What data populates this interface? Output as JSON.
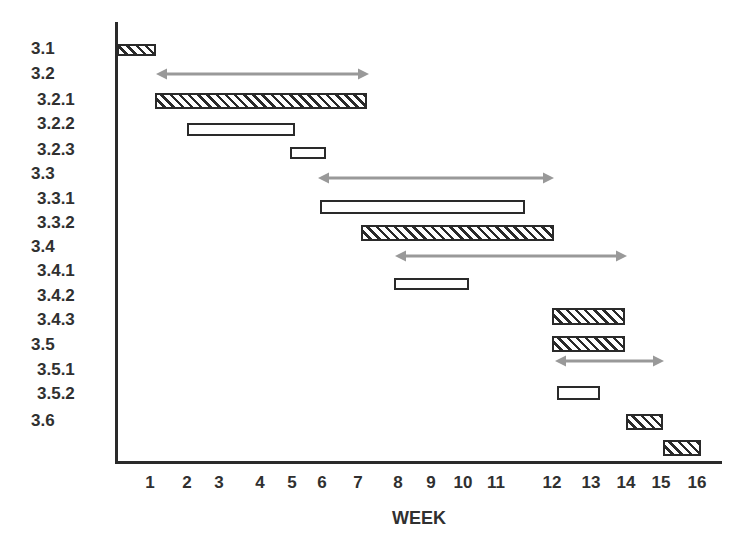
{
  "chart_data": {
    "type": "gantt",
    "title": "",
    "xlabel": "WEEK",
    "ylabel": "",
    "x_ticks": [
      "1",
      "2",
      "3",
      "4",
      "5",
      "6",
      "7",
      "8",
      "9",
      "10",
      "11",
      "12",
      "13",
      "14",
      "15",
      "16"
    ],
    "x_tick_px": [
      150,
      187,
      219,
      260,
      292,
      322,
      358,
      398,
      431,
      463,
      496,
      552,
      591,
      626,
      661,
      697
    ],
    "grid": false,
    "legend": null,
    "style_key": {
      "hatched": "diagonal-hatched bar (task)",
      "open": "outlined white bar (task)",
      "arrow": "grey double-headed arrow (phase span)"
    },
    "colors": {
      "bar_outline": "#2a2a2a",
      "arrow": "#999999",
      "axis": "#2a2a2a",
      "text": "#303030"
    },
    "rows": [
      {
        "label": "3.1",
        "indent": 0,
        "label_y": 49
      },
      {
        "label": "3.2",
        "indent": 0,
        "label_y": 74
      },
      {
        "label": "3.2.1",
        "indent": 1,
        "label_y": 100
      },
      {
        "label": "3.2.2",
        "indent": 1,
        "label_y": 124
      },
      {
        "label": "3.2.3",
        "indent": 1,
        "label_y": 150
      },
      {
        "label": "3.3",
        "indent": 0,
        "label_y": 174
      },
      {
        "label": "3.3.1",
        "indent": 1,
        "label_y": 199
      },
      {
        "label": "3.3.2",
        "indent": 1,
        "label_y": 223
      },
      {
        "label": "3.4",
        "indent": 0,
        "label_y": 247
      },
      {
        "label": "3.4.1",
        "indent": 1,
        "label_y": 271
      },
      {
        "label": "3.4.2",
        "indent": 1,
        "label_y": 296
      },
      {
        "label": "3.4.3",
        "indent": 1,
        "label_y": 320
      },
      {
        "label": "3.5",
        "indent": 0,
        "label_y": 345
      },
      {
        "label": "3.5.1",
        "indent": 1,
        "label_y": 370
      },
      {
        "label": "3.5.2",
        "indent": 1,
        "label_y": 394
      },
      {
        "label": "3.6",
        "indent": 0,
        "label_y": 421
      }
    ],
    "tasks": [
      {
        "row": "3.1",
        "kind": "hatched",
        "start_week": 0,
        "end_week": 1,
        "x0": 117,
        "x1": 156,
        "y0": 44,
        "y1": 56
      },
      {
        "row": "3.2",
        "kind": "arrow",
        "start_week": 1,
        "end_week": 7.3,
        "x0": 156,
        "x1": 369,
        "y": 74
      },
      {
        "row": "3.2.1",
        "kind": "hatched",
        "start_week": 1,
        "end_week": 7.2,
        "x0": 155,
        "x1": 367,
        "y0": 93,
        "y1": 109
      },
      {
        "row": "3.2.2",
        "kind": "open",
        "start_week": 2,
        "end_week": 5,
        "x0": 187,
        "x1": 295,
        "y0": 123,
        "y1": 136
      },
      {
        "row": "3.2.3",
        "kind": "open",
        "start_week": 5,
        "end_week": 6,
        "x0": 290,
        "x1": 326,
        "y0": 147,
        "y1": 159
      },
      {
        "row": "3.3",
        "kind": "arrow",
        "start_week": 6,
        "end_week": 12,
        "x0": 318,
        "x1": 554,
        "y": 178
      },
      {
        "row": "3.3.1",
        "kind": "open",
        "start_week": 6,
        "end_week": 11.8,
        "x0": 320,
        "x1": 525,
        "y0": 200,
        "y1": 214
      },
      {
        "row": "3.3.2",
        "kind": "hatched",
        "start_week": 7,
        "end_week": 12,
        "x0": 361,
        "x1": 554,
        "y0": 225,
        "y1": 241
      },
      {
        "row": "3.4",
        "kind": "arrow",
        "start_week": 8,
        "end_week": 14,
        "x0": 395,
        "x1": 627,
        "y": 256
      },
      {
        "row": "3.4.2",
        "kind": "open",
        "start_week": 8,
        "end_week": 10,
        "x0": 394,
        "x1": 469,
        "y0": 278,
        "y1": 290
      },
      {
        "row": "3.4.3",
        "kind": "hatched",
        "start_week": 12,
        "end_week": 14,
        "x0": 552,
        "x1": 625,
        "y0": 308,
        "y1": 325
      },
      {
        "row": "3.5",
        "kind": "hatched",
        "start_week": 12,
        "end_week": 14,
        "x0": 552,
        "x1": 625,
        "y0": 336,
        "y1": 352
      },
      {
        "row": "3.5.1",
        "kind": "arrow",
        "start_week": 12,
        "end_week": 15,
        "x0": 555,
        "x1": 664,
        "y": 361
      },
      {
        "row": "3.5.2",
        "kind": "open",
        "start_week": 12.1,
        "end_week": 13.2,
        "x0": 557,
        "x1": 600,
        "y0": 386,
        "y1": 400
      },
      {
        "row": "3.6",
        "kind": "hatched",
        "start_week": 14,
        "end_week": 15,
        "x0": 626,
        "x1": 663,
        "y0": 414,
        "y1": 430
      },
      {
        "row": "",
        "kind": "hatched",
        "start_week": 15,
        "end_week": 16,
        "x0": 663,
        "x1": 701,
        "y0": 440,
        "y1": 456
      }
    ]
  }
}
